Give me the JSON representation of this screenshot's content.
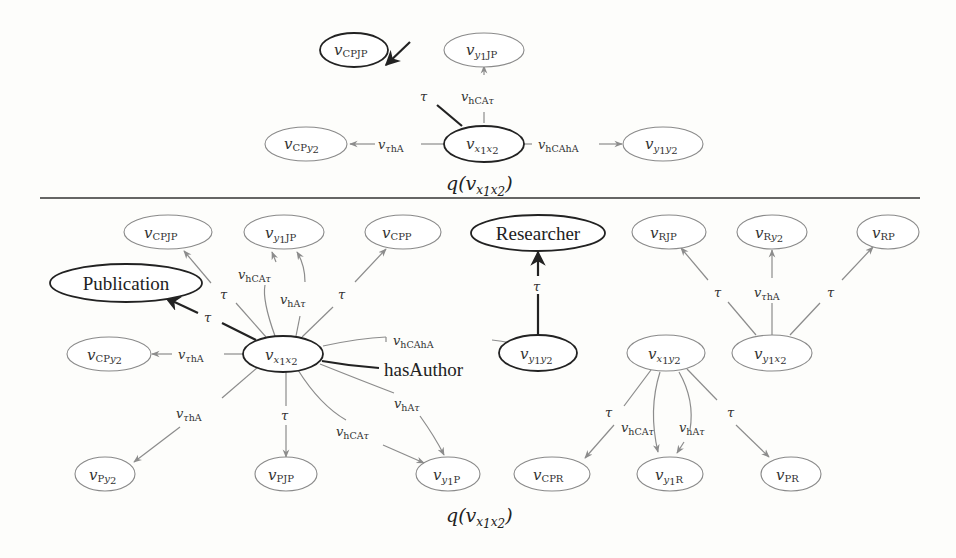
{
  "top_graph": {
    "caption": "q(v_{x1x2})",
    "caption_parts": {
      "q": "q(",
      "v": "v",
      "sub": "x",
      "sub1": "1",
      "sub2": "x",
      "sub3": "2",
      "close": ")"
    },
    "nodes": [
      {
        "id": "t_CPJP",
        "label": "v",
        "sub": "CPJP",
        "style": "dark"
      },
      {
        "id": "t_y1JP",
        "label": "v",
        "sub_i": "y",
        "sub_n": "1",
        "sub_tail": "JP",
        "style": "light"
      },
      {
        "id": "t_CPy2",
        "label": "v",
        "sub": "CP",
        "sub_i": "y",
        "sub_n": "2",
        "style": "light"
      },
      {
        "id": "t_x1x2",
        "label": "v",
        "style": "dark"
      },
      {
        "id": "t_y1y2",
        "label": "v",
        "style": "light"
      }
    ],
    "edges": [
      {
        "from": "t_x1x2",
        "to": "t_CPJP",
        "label": "τ",
        "style": "dark"
      },
      {
        "from": "t_x1x2",
        "to": "t_y1JP",
        "label": "v_hCAτ",
        "style": "light"
      },
      {
        "from": "t_x1x2",
        "to": "t_CPy2",
        "label": "v_τhA",
        "style": "light"
      },
      {
        "from": "t_x1x2",
        "to": "t_y1y2",
        "label": "v_hCAhA",
        "style": "light"
      }
    ],
    "labels": {
      "tau": "τ",
      "v": "v",
      "hCA": "hCA",
      "hA": "hA",
      "hCAhA": "hCAhA",
      "tauhA_h": "hA"
    }
  },
  "bottom_graph": {
    "caption": "q(v_{x1x2})",
    "class_nodes": {
      "publication": "Publication",
      "researcher": "Researcher"
    },
    "property_label": "hasAuthor",
    "node_subs": {
      "CPJP": "CPJP",
      "JP": "JP",
      "CPP": "CPP",
      "RJP": "RJP",
      "R": "R",
      "RP": "RP",
      "CP": "CP",
      "PJP": "PJP",
      "P": "P",
      "CPR": "CPR",
      "PR": "PR"
    },
    "nodes": [
      "v_CPJP",
      "v_y1JP",
      "v_CPP",
      "Researcher",
      "v_RJP",
      "v_Ry2",
      "v_RP",
      "Publication",
      "v_CPy2",
      "v_x1x2",
      "v_y1y2",
      "v_x1y2",
      "v_y1x2",
      "v_Py2",
      "v_PJP",
      "v_y1P",
      "v_CPR",
      "v_y1R",
      "v_PR"
    ],
    "edges": [
      {
        "from": "v_x1x2",
        "to": "v_CPJP",
        "label": "τ"
      },
      {
        "from": "v_x1x2",
        "to": "v_y1JP",
        "label": "v_hCAτ"
      },
      {
        "from": "v_x1x2",
        "to": "v_y1JP",
        "label": "v_hAτ"
      },
      {
        "from": "v_x1x2",
        "to": "v_CPP",
        "label": "τ"
      },
      {
        "from": "v_x1x2",
        "to": "Publication",
        "label": "τ",
        "style": "dark"
      },
      {
        "from": "v_x1x2",
        "to": "v_CPy2",
        "label": "v_τhA"
      },
      {
        "from": "v_x1x2",
        "to": "v_y1y2",
        "label": "v_hCAhA"
      },
      {
        "from": "v_x1x2",
        "to": "v_y1y2",
        "label": "hasAuthor",
        "style": "dark"
      },
      {
        "from": "v_x1x2",
        "to": "v_Py2",
        "label": "v_τhA"
      },
      {
        "from": "v_x1x2",
        "to": "v_PJP",
        "label": "τ"
      },
      {
        "from": "v_x1x2",
        "to": "v_y1P",
        "label": "v_hCAτ"
      },
      {
        "from": "v_x1x2",
        "to": "v_y1P",
        "label": "v_hAτ"
      },
      {
        "from": "v_y1y2",
        "to": "Researcher",
        "label": "τ",
        "style": "dark"
      },
      {
        "from": "v_y1x2",
        "to": "v_RJP",
        "label": "τ"
      },
      {
        "from": "v_y1x2",
        "to": "v_Ry2",
        "label": "v_τhA"
      },
      {
        "from": "v_y1x2",
        "to": "v_RP",
        "label": "τ"
      },
      {
        "from": "v_x1y2",
        "to": "v_CPR",
        "label": "τ"
      },
      {
        "from": "v_x1y2",
        "to": "v_y1R",
        "label": "v_hCAτ"
      },
      {
        "from": "v_x1y2",
        "to": "v_y1R",
        "label": "v_hAτ"
      },
      {
        "from": "v_x1y2",
        "to": "v_PR",
        "label": "τ"
      }
    ]
  },
  "colors": {
    "dark": "#222222",
    "light": "#8c8c8c",
    "background": "#fdfdfb"
  }
}
